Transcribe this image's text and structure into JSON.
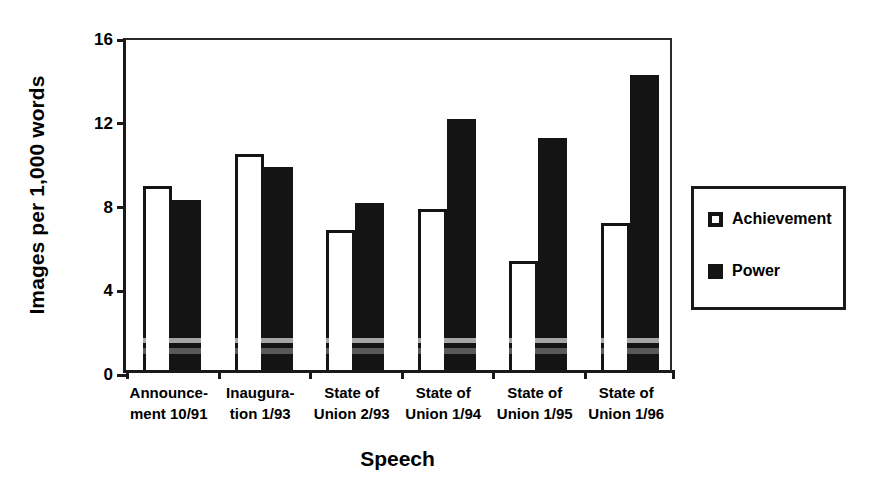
{
  "chart_data": {
    "type": "bar",
    "title": "",
    "xlabel": "Speech",
    "ylabel": "Images per 1,000 words",
    "ylim": [
      0,
      16
    ],
    "yticks": [
      0,
      4,
      8,
      12,
      16
    ],
    "grid": false,
    "legend_position": "right",
    "categories": [
      "Announcement 10/91",
      "Inauguration 1/93",
      "State of Union 2/93",
      "State of Union 1/94",
      "State of Union 1/95",
      "State of Union 1/96"
    ],
    "category_lines": [
      [
        "Announce-",
        "ment 10/91"
      ],
      [
        "Inaugura-",
        "tion 1/93"
      ],
      [
        "State of",
        "Union 2/93"
      ],
      [
        "State of",
        "Union 1/94"
      ],
      [
        "State of",
        "Union 1/95"
      ],
      [
        "State of",
        "Union 1/96"
      ]
    ],
    "series": [
      {
        "name": "Achievement",
        "color": "#ffffff",
        "border_color": "#141414",
        "values": [
          8.8,
          10.3,
          6.7,
          7.7,
          5.2,
          7.0
        ]
      },
      {
        "name": "Power",
        "color": "#141414",
        "border_color": "#141414",
        "values": [
          8.1,
          9.7,
          8.0,
          12.0,
          11.1,
          14.1
        ]
      }
    ]
  },
  "axes": {
    "y_title": "Images per 1,000 words",
    "x_title": "Speech",
    "y_tick_labels": [
      "0",
      "4",
      "8",
      "12",
      "16"
    ]
  },
  "legend": {
    "entries": [
      {
        "label": "Achievement",
        "swatch": "achievement"
      },
      {
        "label": "Power",
        "swatch": "power"
      }
    ]
  },
  "colors": {
    "ink": "#141414",
    "axis": "#1a1a1a",
    "background": "#ffffff"
  }
}
